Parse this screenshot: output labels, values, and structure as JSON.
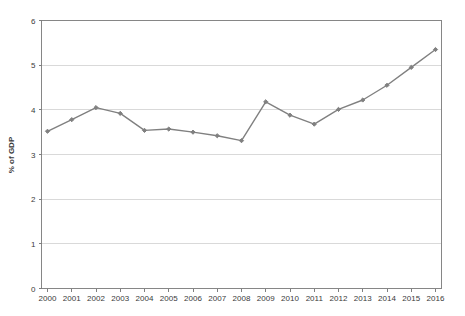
{
  "chart_data": {
    "type": "line",
    "title": "",
    "subtitle": "",
    "xlabel": "",
    "ylabel": "% of GDP",
    "categories": [
      "2000",
      "2001",
      "2002",
      "2003",
      "2004",
      "2005",
      "2006",
      "2007",
      "2008",
      "2009",
      "2010",
      "2011",
      "2012",
      "2013",
      "2014",
      "2015",
      "2016"
    ],
    "values": [
      3.52,
      3.78,
      4.05,
      3.92,
      3.54,
      3.57,
      3.5,
      3.42,
      3.31,
      4.18,
      3.88,
      3.68,
      4.01,
      4.22,
      4.55,
      4.95,
      5.35
    ],
    "series": [
      {
        "name": "% of GDP",
        "values": [
          3.52,
          3.78,
          4.05,
          3.92,
          3.54,
          3.57,
          3.5,
          3.42,
          3.31,
          4.18,
          3.88,
          3.68,
          4.01,
          4.22,
          4.55,
          4.95,
          5.35
        ]
      }
    ],
    "ylim": [
      0,
      6
    ],
    "yticks": [
      "0",
      "1",
      "2",
      "3",
      "4",
      "5",
      "6"
    ],
    "ytick_values": [
      0,
      1,
      2,
      3,
      4,
      5,
      6
    ],
    "grid": true,
    "grid_axis": "y",
    "legend": false,
    "legend_position": "none",
    "marker": "diamond",
    "line_color": "#808080",
    "marker_color": "#808080",
    "grid_color": "#d9d9d9",
    "axis_color": "#7f7f7f",
    "background_color": "#ffffff"
  }
}
